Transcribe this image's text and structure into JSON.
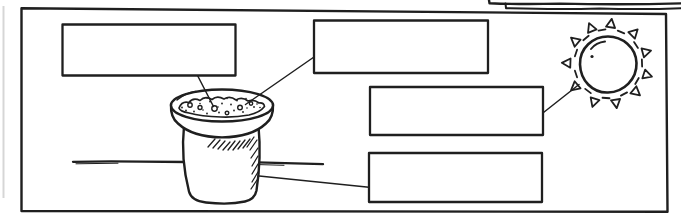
{
  "page": {
    "paper_color": "#ffffff",
    "ink_color": "#1f1f1f",
    "scan_edge_color": "#cccccc",
    "text_content": ""
  },
  "diagram": {
    "type": "labeling-worksheet",
    "label_boxes": [
      {
        "id": 1,
        "position": "top-left",
        "label": "",
        "line_points_to": "seed-in-soil"
      },
      {
        "id": 2,
        "position": "top-center",
        "label": "",
        "line_points_to": "soil-surface"
      },
      {
        "id": 3,
        "position": "middle-right",
        "label": "",
        "line_points_to": "sun"
      },
      {
        "id": 4,
        "position": "bottom-right",
        "label": "",
        "line_points_to": "pot-body"
      }
    ],
    "drawings": [
      {
        "name": "flower-pot",
        "detail": "clay pot filled with soil and scattered seed dots"
      },
      {
        "name": "sun",
        "detail": "circle with alternating hollow-triangle and dash rays"
      },
      {
        "name": "ground-line",
        "detail": "horizontal sketched line behind the pot"
      },
      {
        "name": "cutoff-banner",
        "detail": "bottom edge of a title box cut off at the top-right"
      }
    ]
  }
}
